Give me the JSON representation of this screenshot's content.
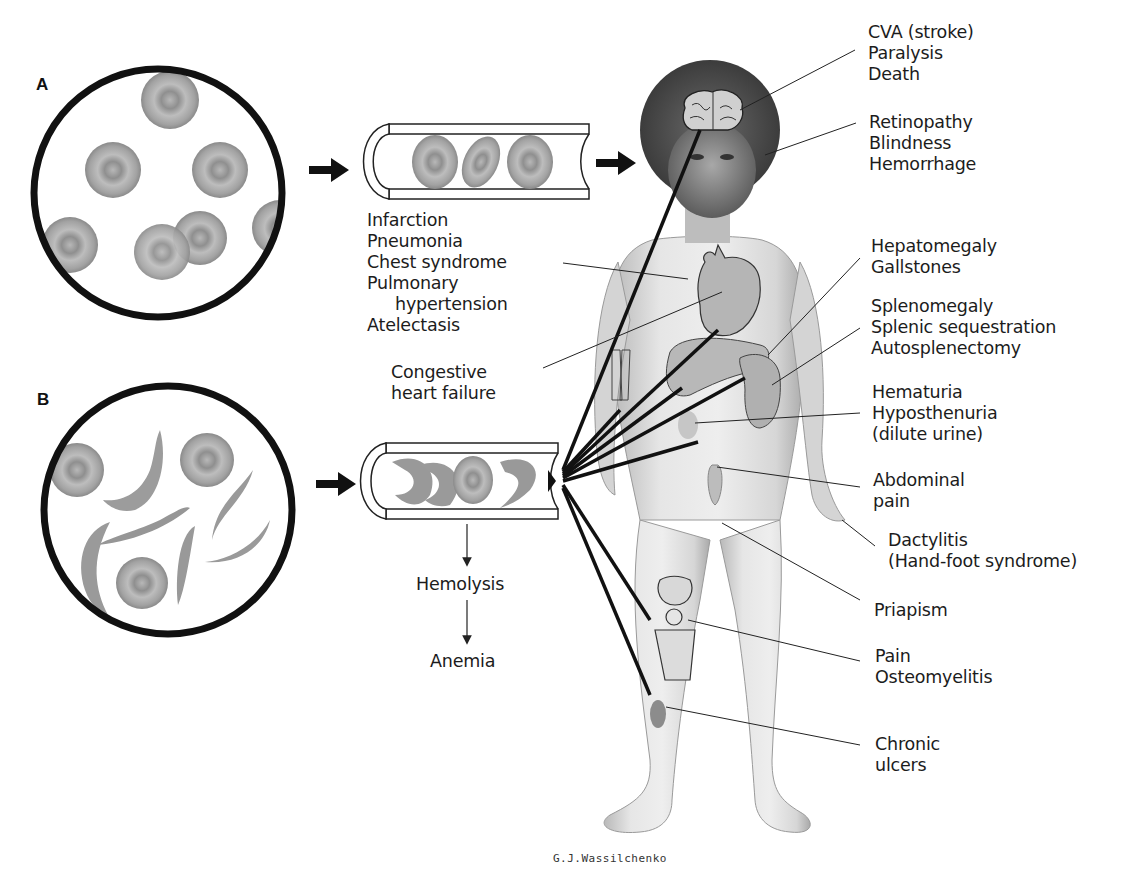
{
  "figure": {
    "panels": [
      {
        "id": "A",
        "label": "A",
        "description": "Normal red blood cells (biconcave discs)"
      },
      {
        "id": "B",
        "label": "B",
        "description": "Sickle-shaped red blood cells mixed with normal cells"
      }
    ],
    "vessel_a_labels": [
      "Infarction",
      "Pneumonia",
      "Chest syndrome",
      "Pulmonary",
      "hypertension",
      "Atelectasis"
    ],
    "congestive": [
      "Congestive",
      "heart failure"
    ],
    "vessel_b_flow": {
      "step1": "Hemolysis",
      "step2": "Anemia"
    },
    "right_labels": {
      "brain": [
        "CVA (stroke)",
        "Paralysis",
        "Death"
      ],
      "eye": [
        "Retinopathy",
        "Blindness",
        "Hemorrhage"
      ],
      "liver": [
        "Hepatomegaly",
        "Gallstones"
      ],
      "spleen": [
        "Splenomegaly",
        "Splenic sequestration",
        "Autosplenectomy"
      ],
      "kidney": [
        "Hematuria",
        "Hyposthenuria",
        "(dilute urine)"
      ],
      "abdomen": [
        "Abdominal",
        "pain"
      ],
      "hand": [
        "Dactylitis",
        "(Hand-foot syndrome)"
      ],
      "genital": [
        "Priapism"
      ],
      "bone": [
        "Pain",
        "Osteomyelitis"
      ],
      "skin": [
        "Chronic",
        "ulcers"
      ]
    },
    "signature": "G.J.Wassilchenko"
  },
  "colors": {
    "cell_fill": "#9a9a9a",
    "cell_light": "#c4c4c4",
    "outline": "#111111",
    "skin": "#dedede",
    "organ": "#b3b3b3",
    "hair": "#4a4a4a"
  }
}
